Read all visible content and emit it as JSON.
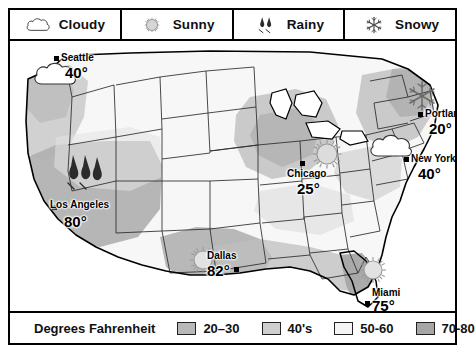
{
  "map": {
    "title": "US Weather Map",
    "region": "United States"
  },
  "weather_legend": {
    "items": [
      {
        "icon": "cloud-icon",
        "label": "Cloudy"
      },
      {
        "icon": "sun-icon",
        "label": "Sunny"
      },
      {
        "icon": "raindrops-icon",
        "label": "Rainy"
      },
      {
        "icon": "snowflake-icon",
        "label": "Snowy"
      }
    ]
  },
  "temperature_legend": {
    "title": "Degrees Fahrenheit",
    "bands": [
      {
        "label": "20–30",
        "color": "#b8b8b8"
      },
      {
        "label": "40's",
        "color": "#cfcfcf"
      },
      {
        "label": "50-60",
        "color": "#f2f2f2"
      },
      {
        "label": "70-80",
        "color": "#a6a6a6"
      }
    ]
  },
  "cities": [
    {
      "name": "Seattle",
      "temp": "40°",
      "condition": "Cloudy",
      "icon": "cloud-icon"
    },
    {
      "name": "Los Angeles",
      "temp": "80°",
      "condition": "Rainy",
      "icon": "raindrops-icon"
    },
    {
      "name": "Dallas",
      "temp": "82°",
      "condition": "Sunny",
      "icon": "sun-icon"
    },
    {
      "name": "Chicago",
      "temp": "25°",
      "condition": "Sunny",
      "icon": "sun-icon"
    },
    {
      "name": "Portland",
      "temp": "20°",
      "condition": "Snowy",
      "icon": "snowflake-icon"
    },
    {
      "name": "New York",
      "temp": "40°",
      "condition": "Cloudy",
      "icon": "cloud-icon"
    },
    {
      "name": "Miami",
      "temp": "75°",
      "condition": "Sunny",
      "icon": "sun-icon"
    }
  ],
  "colors": {
    "band_20_30": "#b8b8b8",
    "band_40s": "#cfcfcf",
    "band_50_60": "#f2f2f2",
    "band_70_80": "#a6a6a6",
    "outline": "#000000",
    "state_line": "#1a1a1a"
  }
}
